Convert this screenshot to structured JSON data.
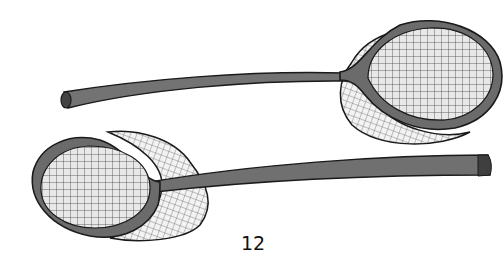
{
  "illustration": {
    "subject": "two hand nets with long wooden handles",
    "items": [
      {
        "name": "top-net",
        "orientation": "handle pointing left, hoop on right"
      },
      {
        "name": "bottom-net",
        "orientation": "handle pointing right, hoop on left"
      }
    ],
    "colors": {
      "outline": "#1a1a1a",
      "frame": "#6b6b6b",
      "handle": "#707070",
      "mesh_inner": "#e6e6e6",
      "mesh_outer": "#f2f2f2",
      "background": "#ffffff"
    }
  },
  "page": {
    "number": "12"
  }
}
